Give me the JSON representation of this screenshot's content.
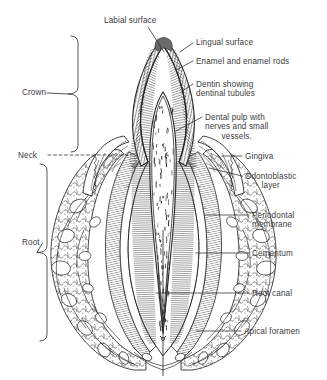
{
  "figure": {
    "ink_color": "#2b2b2b",
    "text_color": "#3c3c3c",
    "background_color": "#ffffff",
    "width": 327,
    "height": 380
  },
  "brackets": [
    {
      "id": "crown",
      "label": "Crown",
      "label_x": 22,
      "label_y": 88,
      "x": 78,
      "y_top": 36,
      "y_bottom": 152,
      "tip_x": 68
    },
    {
      "id": "root",
      "label": "Root",
      "label_x": 22,
      "label_y": 238,
      "x": 47,
      "y_top": 164,
      "y_bottom": 341,
      "tip_x": 37
    }
  ],
  "labels": [
    {
      "id": "labial-surface",
      "text": "Labial surface",
      "x": 104,
      "y": 16,
      "align": "left",
      "lines": [
        "Labial surface"
      ]
    },
    {
      "id": "neck",
      "text": "Neck",
      "x": 18,
      "y": 151,
      "align": "left",
      "lines": [
        "Neck"
      ]
    },
    {
      "id": "lingual-surface",
      "text": "Lingual surface",
      "x": 196,
      "y": 38,
      "align": "left",
      "lines": [
        "Lingual surface"
      ]
    },
    {
      "id": "enamel-rods",
      "text": "Enamel and enamel rods",
      "x": 196,
      "y": 57,
      "align": "left",
      "lines": [
        "Enamel and enamel rods"
      ]
    },
    {
      "id": "dentin-tubules",
      "text": "Dentin showing dentinal tubules",
      "x": 196,
      "y": 80,
      "align": "left",
      "lines": [
        "Dentin showing",
        "dentinal tubules"
      ]
    },
    {
      "id": "dental-pulp",
      "text": "Dental pulp with nerves and small vessels.",
      "x": 205,
      "y": 113,
      "align": "left",
      "lines": [
        "Dental pulp with",
        "nerves and small",
        "vessels."
      ]
    },
    {
      "id": "gingiva",
      "text": "Gingiva",
      "x": 245,
      "y": 152,
      "align": "left",
      "lines": [
        "Gingiva"
      ]
    },
    {
      "id": "odontoblastic",
      "text": "Odontoblastic layer",
      "x": 245,
      "y": 172,
      "align": "left",
      "lines": [
        "Odontoblastic",
        "layer"
      ]
    },
    {
      "id": "periodontal",
      "text": "Periodontal membrane",
      "x": 252,
      "y": 211,
      "align": "left",
      "lines": [
        "Periodontal",
        "membrane"
      ]
    },
    {
      "id": "cementum",
      "text": "Cementum",
      "x": 252,
      "y": 249,
      "align": "left",
      "lines": [
        "Cementum"
      ]
    },
    {
      "id": "root-canal",
      "text": "Root canal",
      "x": 252,
      "y": 289,
      "align": "left",
      "lines": [
        "Root canal"
      ]
    },
    {
      "id": "apical-foramen",
      "text": "Apical foramen",
      "x": 244,
      "y": 327,
      "align": "left",
      "lines": [
        "Apical foramen"
      ]
    }
  ],
  "leaders": [
    {
      "id": "leader-labial-surface",
      "points": "148,27 164,52",
      "dashed": false
    },
    {
      "id": "leader-neck",
      "points": "48,155 131,155",
      "dashed": true
    },
    {
      "id": "leader-lingual-surface",
      "points": "193,43 180,52",
      "dashed": false
    },
    {
      "id": "leader-enamel-rods",
      "points": "193,61 176,70",
      "dashed": false
    },
    {
      "id": "leader-dentin-tubules",
      "points": "193,84 181,92",
      "dashed": false
    },
    {
      "id": "leader-dental-pulp",
      "points": "202,117 176,131",
      "dashed": false
    },
    {
      "id": "leader-gingiva",
      "points": "242,156 222,156",
      "dashed": false
    },
    {
      "id": "leader-odontoblastic",
      "points": "242,176 209,168",
      "dashed": false
    },
    {
      "id": "leader-periodontal",
      "points": "249,215 205,215",
      "dashed": false
    },
    {
      "id": "leader-cementum",
      "points": "249,253 196,253",
      "dashed": false
    },
    {
      "id": "leader-root-canal",
      "points": "249,293 156,293",
      "dashed": false
    },
    {
      "id": "leader-apical-foramen",
      "points": "241,331 196,331",
      "dashed": false
    }
  ],
  "anatomy": {
    "regions": [
      {
        "id": "enamel",
        "name": "Enamel and enamel rods"
      },
      {
        "id": "dentin",
        "name": "Dentin showing dentinal tubules"
      },
      {
        "id": "pulp-chamber",
        "name": "Dental pulp with nerves and small vessels"
      },
      {
        "id": "odontoblastic-layer",
        "name": "Odontoblastic layer"
      },
      {
        "id": "gingiva",
        "name": "Gingiva"
      },
      {
        "id": "periodontal-membrane",
        "name": "Periodontal membrane"
      },
      {
        "id": "cementum",
        "name": "Cementum"
      },
      {
        "id": "alveolar-bone",
        "name": "Alveolar bone (trabecular)"
      },
      {
        "id": "root-canal",
        "name": "Root canal"
      },
      {
        "id": "apical-foramen",
        "name": "Apical foramen"
      }
    ]
  }
}
